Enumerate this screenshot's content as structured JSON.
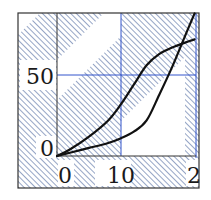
{
  "chart_data": {
    "type": "line",
    "title": "",
    "xlabel": "",
    "ylabel": "",
    "xlim": [
      0,
      21.5
    ],
    "ylim": [
      -20,
      88
    ],
    "x_ticks": [
      "0",
      "10",
      "2"
    ],
    "y_ticks": [
      "0",
      "50"
    ],
    "grid": true,
    "legend": null,
    "background": "diagonal hatching with white diagonal bands",
    "series": [
      {
        "name": "curve-upper",
        "color": "#111111",
        "x": [
          0,
          2,
          5,
          8,
          10,
          12,
          14,
          16,
          18,
          20,
          21.5
        ],
        "y": [
          0,
          4,
          12,
          22,
          32,
          44,
          56,
          63,
          67,
          70,
          72
        ]
      },
      {
        "name": "curve-lower",
        "color": "#111111",
        "x": [
          0,
          2,
          5,
          8,
          10,
          12,
          14,
          16,
          18,
          20,
          21.5
        ],
        "y": [
          0,
          2,
          5,
          8,
          11,
          15,
          22,
          38,
          55,
          74,
          88
        ]
      }
    ],
    "colors": {
      "hatch": "#8a9cc0",
      "grid": "#3355cc",
      "frame": "#333333",
      "line": "#111111"
    }
  }
}
